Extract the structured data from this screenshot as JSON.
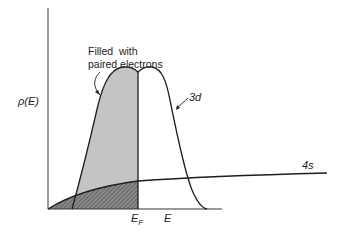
{
  "diagram": {
    "y_axis_label": "ρ(E)",
    "x_axis_label": "E",
    "fermi_label": "E",
    "fermi_sub": "F",
    "annotation_line1": "Filled  with",
    "annotation_line2": "paired electrons",
    "band_3d_label": "3d",
    "band_4s_label": "4s",
    "colors": {
      "line": "#1e1e1e",
      "filled_3d": "#c4c4c4",
      "filled_4s": "#7a7a7a"
    }
  }
}
